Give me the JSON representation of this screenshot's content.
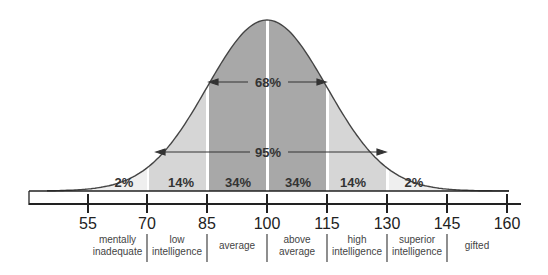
{
  "chart_data": {
    "type": "area",
    "title": "",
    "xlabel": "IQ score",
    "ylabel": "",
    "x_ticks": [
      55,
      70,
      85,
      100,
      115,
      130,
      145,
      160
    ],
    "xlim": [
      45,
      162
    ],
    "distribution": {
      "kind": "normal",
      "mean": 100,
      "sd": 15
    },
    "bands": [
      {
        "from": 55,
        "to": 70,
        "label": "2%",
        "value": 2,
        "color": "#efefef"
      },
      {
        "from": 70,
        "to": 85,
        "label": "14%",
        "value": 14,
        "color": "#d6d6d6"
      },
      {
        "from": 85,
        "to": 100,
        "label": "34%",
        "value": 34,
        "color": "#a8a8a8"
      },
      {
        "from": 100,
        "to": 115,
        "label": "34%",
        "value": 34,
        "color": "#a8a8a8"
      },
      {
        "from": 115,
        "to": 130,
        "label": "14%",
        "value": 14,
        "color": "#d6d6d6"
      },
      {
        "from": 130,
        "to": 145,
        "label": "2%",
        "value": 2,
        "color": "#efefef"
      }
    ],
    "annotations": [
      {
        "text": "68%",
        "range": [
          85,
          115
        ],
        "type": "double-arrow"
      },
      {
        "text": "95%",
        "range": [
          70,
          130
        ],
        "type": "double-arrow"
      }
    ],
    "categories": [
      {
        "range": [
          55,
          70
        ],
        "label": "mentally inadequate"
      },
      {
        "range": [
          70,
          85
        ],
        "label": "low intelligence"
      },
      {
        "range": [
          85,
          100
        ],
        "label": "average"
      },
      {
        "range": [
          100,
          115
        ],
        "label": "above average"
      },
      {
        "range": [
          115,
          130
        ],
        "label": "high intelligence"
      },
      {
        "range": [
          130,
          145
        ],
        "label": "superior intelligence"
      },
      {
        "range": [
          145,
          160
        ],
        "label": "gifted"
      }
    ],
    "grid": false,
    "legend": "none"
  },
  "labels": {
    "b0": "2%",
    "b1": "14%",
    "b2": "34%",
    "b3": "34%",
    "b4": "14%",
    "b5": "2%",
    "a68": "68%",
    "a95": "95%",
    "t55": "55",
    "t70": "70",
    "t85": "85",
    "t100": "100",
    "t115": "115",
    "t130": "130",
    "t145": "145",
    "t160": "160",
    "c0a": "mentally",
    "c0b": "inadequate",
    "c1a": "low",
    "c1b": "intelligence",
    "c2a": "average",
    "c3a": "above",
    "c3b": "average",
    "c4a": "high",
    "c4b": "intelligence",
    "c5a": "superior",
    "c5b": "intelligence",
    "c6a": "gifted"
  }
}
